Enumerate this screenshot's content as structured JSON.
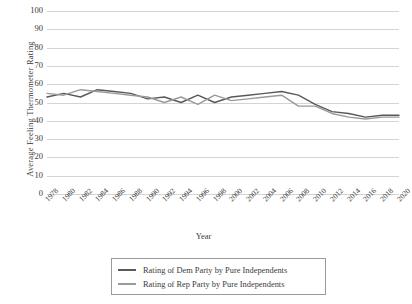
{
  "chart_data": {
    "type": "line",
    "title": "",
    "xlabel": "Year",
    "ylabel": "Average Feeling Thermometer Rating",
    "ylim": [
      0,
      100
    ],
    "ytick_step": 10,
    "yticks": [
      100,
      90,
      80,
      70,
      60,
      50,
      40,
      30,
      20,
      10,
      0
    ],
    "grid": true,
    "legend_position": "bottom",
    "x": [
      1978,
      1980,
      1982,
      1984,
      1986,
      1988,
      1990,
      1992,
      1994,
      1996,
      1998,
      2000,
      2002,
      2004,
      2006,
      2008,
      2010,
      2012,
      2014,
      2016,
      2018,
      2020
    ],
    "categories": [
      "1978",
      "1980",
      "1982",
      "1984",
      "1986",
      "1988",
      "1990",
      "1992",
      "1994",
      "1996",
      "1998",
      "2000",
      "2002",
      "2004",
      "2006",
      "2008",
      "2010",
      "2012",
      "2014",
      "2016",
      "2018",
      "2020"
    ],
    "series": [
      {
        "name": "Rating of Dem Party by Pure Independents",
        "color": "#595959",
        "values": [
          53,
          55,
          53,
          57,
          56,
          55,
          52,
          53,
          50,
          54,
          50,
          53,
          54,
          55,
          56,
          54,
          49,
          45,
          44,
          42,
          43,
          43
        ]
      },
      {
        "name": "Rating of Rep Party by Pure Independents",
        "color": "#9a9a9a",
        "values": [
          55,
          54,
          57,
          56,
          55,
          54,
          53,
          50,
          53,
          49,
          54,
          51,
          52,
          53,
          54,
          48,
          48,
          44,
          42,
          41,
          42,
          42
        ]
      }
    ]
  },
  "legend": {
    "entries": [
      {
        "label": "Rating of Dem Party by Pure Independents"
      },
      {
        "label": "Rating of Rep Party by Pure Independents"
      }
    ]
  },
  "axes": {
    "y_title": "Average Feeling Thermometer Rating",
    "x_title": "Year"
  },
  "colors": {
    "dem_line": "#595959",
    "rep_line": "#9a9a9a",
    "gridline": "#d4d4d4",
    "text": "#3a3a3a",
    "legend_border": "#9a9a9a",
    "background": "#ffffff"
  }
}
